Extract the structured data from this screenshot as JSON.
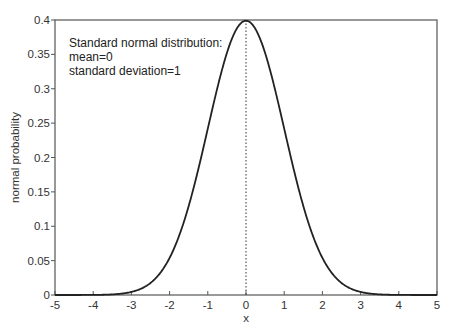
{
  "chart_data": {
    "type": "line",
    "title": "",
    "xlabel": "x",
    "ylabel": "normal probability",
    "xlim": [
      -5,
      5
    ],
    "ylim": [
      0,
      0.4
    ],
    "grid": false,
    "x_ticks": [
      -5,
      -4,
      -3,
      -2,
      -1,
      0,
      1,
      2,
      3,
      4,
      5
    ],
    "x_tick_labels": [
      "-5",
      "-4",
      "-3",
      "-2",
      "-1",
      "0",
      "1",
      "2",
      "3",
      "4",
      "5"
    ],
    "y_ticks": [
      0,
      0.05,
      0.1,
      0.15,
      0.2,
      0.25,
      0.3,
      0.35,
      0.4
    ],
    "y_tick_labels": [
      "0",
      "0.05",
      "0.1",
      "0.15",
      "0.2",
      "0.25",
      "0.3",
      "0.35",
      "0.4"
    ],
    "series": [
      {
        "name": "Standard normal PDF",
        "function": "normal_pdf",
        "mean": 0,
        "sd": 1,
        "x": [
          -5,
          -4.5,
          -4,
          -3.5,
          -3,
          -2.5,
          -2,
          -1.5,
          -1,
          -0.5,
          0,
          0.5,
          1,
          1.5,
          2,
          2.5,
          3,
          3.5,
          4,
          4.5,
          5
        ],
        "y": [
          1.5e-06,
          1.6e-05,
          0.000134,
          0.000873,
          0.00443,
          0.0175,
          0.054,
          0.1295,
          0.242,
          0.3521,
          0.3989,
          0.3521,
          0.242,
          0.1295,
          0.054,
          0.0175,
          0.00443,
          0.000873,
          0.000134,
          1.6e-05,
          1.5e-06
        ]
      }
    ],
    "reference_line": {
      "orientation": "vertical",
      "x": 0,
      "style": "dotted"
    },
    "annotations": [
      "Standard normal distribution:",
      "mean=0",
      "standard deviation=1"
    ],
    "legend": "none"
  }
}
